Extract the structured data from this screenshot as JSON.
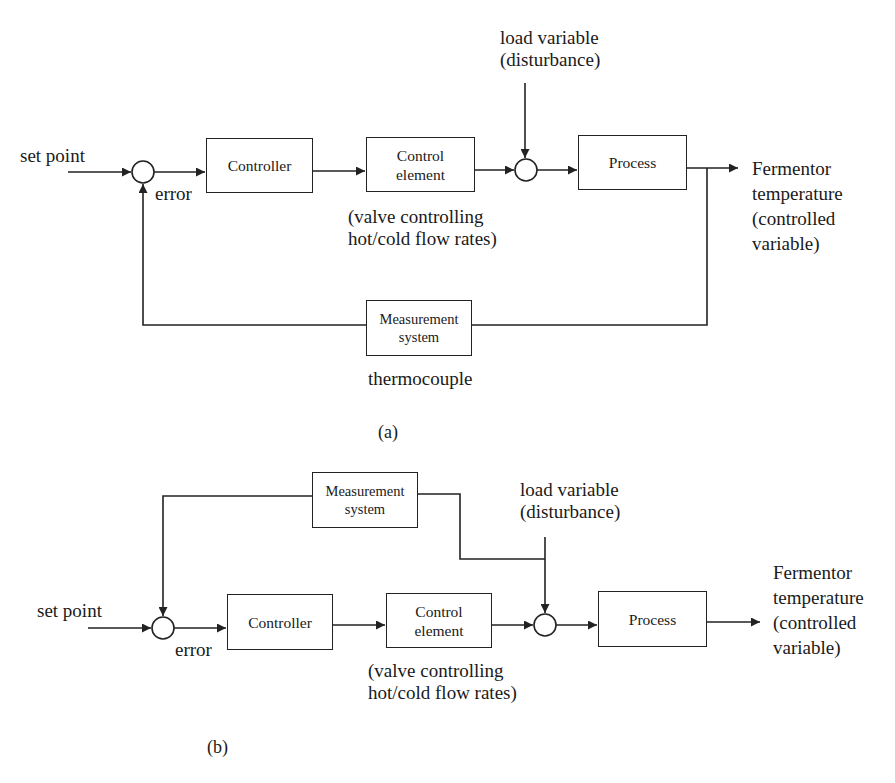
{
  "diagram_a": {
    "caption": "(a)",
    "set_point": "set point",
    "error": "error",
    "controller": "Controller",
    "control_element": [
      "Control",
      "element"
    ],
    "control_element_note": [
      "(valve controlling",
      "hot/cold flow rates)"
    ],
    "load_variable": [
      "load variable",
      "(disturbance)"
    ],
    "process": "Process",
    "output": [
      "Fermentor",
      "temperature",
      "(controlled",
      "variable)"
    ],
    "measurement": [
      "Measurement",
      "system"
    ],
    "measurement_note": "thermocouple"
  },
  "diagram_b": {
    "caption": "(b)",
    "set_point": "set point",
    "error": "error",
    "controller": "Controller",
    "control_element": [
      "Control",
      "element"
    ],
    "control_element_note": [
      "(valve controlling",
      "hot/cold flow rates)"
    ],
    "load_variable": [
      "load variable",
      "(disturbance)"
    ],
    "process": "Process",
    "output": [
      "Fermentor",
      "temperature",
      "(controlled",
      "variable)"
    ],
    "measurement": [
      "Measurement",
      "system"
    ]
  },
  "colors": {
    "line": "#222222",
    "background": "#ffffff"
  }
}
